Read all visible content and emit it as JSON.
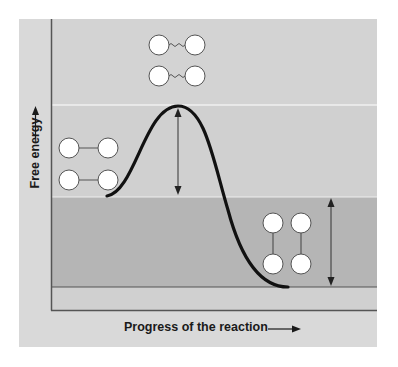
{
  "diagram": {
    "y_axis": {
      "label": "Free energy",
      "arrow": "up-arrow"
    },
    "x_axis": {
      "label": "Progress of the reaction",
      "arrow": "right-arrow"
    },
    "colors": {
      "panel": "#d9d9d9",
      "upper_band": "#d3d3d3",
      "middle_band": "#d0d0d0",
      "lower_band": "#b5b5b5",
      "bottom_band": "#d0d0d0",
      "curve": "#111111",
      "axis": "#555555",
      "atom_fill": "#ffffff",
      "atom_stroke": "#555555",
      "band_divider": "#f0f0f0"
    },
    "states": [
      {
        "name": "reactants",
        "description": "Two molecules with solid horizontal bonds",
        "bond": "straight"
      },
      {
        "name": "transition-state",
        "description": "Two molecules with wavy partial bonds",
        "bond": "wavy"
      },
      {
        "name": "products",
        "description": "Two molecules with solid vertical bonds",
        "bond": "straight"
      }
    ],
    "annotations": [
      {
        "name": "activation-energy-arrow",
        "type": "double-arrow",
        "from": "reactant level",
        "to": "transition state peak"
      },
      {
        "name": "free-energy-change-arrow",
        "type": "double-arrow",
        "from": "reactant level",
        "to": "product level"
      }
    ],
    "levels": {
      "transition_state_y": 105,
      "reactants_y": 197,
      "products_y": 287
    }
  }
}
